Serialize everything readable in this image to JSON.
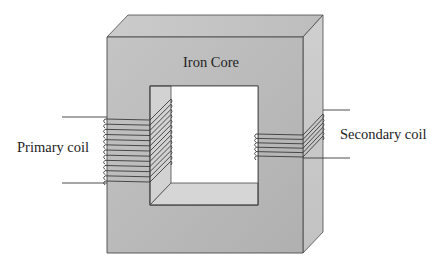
{
  "diagram": {
    "labels": {
      "core": "Iron Core",
      "primary": "Primary coil",
      "secondary": "Secondary coil"
    },
    "colors": {
      "front_face": "#b9b9b9",
      "top_face": "#c6c6c6",
      "side_face": "#cdcdcd",
      "inner_face": "#d4d4d4",
      "window": "#ffffff",
      "outline": "#4a4a4a",
      "coil": "#3a3a3a"
    },
    "primary_coil_turns": 13,
    "secondary_coil_turns": 6
  }
}
